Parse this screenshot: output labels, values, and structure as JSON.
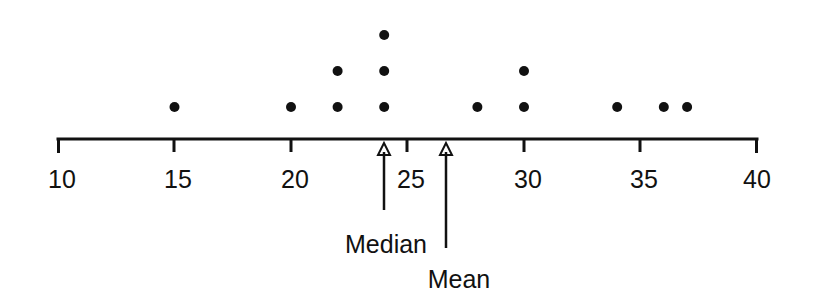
{
  "chart_data": {
    "type": "scatter",
    "plot_kind": "dot-plot",
    "title": "",
    "subtitle": "",
    "xlabel": "",
    "ylabel": "",
    "xlim": [
      10,
      40
    ],
    "grid": false,
    "legend": null,
    "axis_ticks": [
      10,
      15,
      20,
      25,
      30,
      35,
      40
    ],
    "tick_labels": [
      "10",
      "15",
      "20",
      "25",
      "30",
      "35",
      "40"
    ],
    "minor_ticks": false,
    "values": [
      15,
      20,
      22,
      22,
      24,
      24,
      24,
      28,
      30,
      30,
      34,
      36,
      37
    ],
    "stacks": [
      {
        "x": 15,
        "count": 1
      },
      {
        "x": 20,
        "count": 1
      },
      {
        "x": 22,
        "count": 2
      },
      {
        "x": 24,
        "count": 3
      },
      {
        "x": 28,
        "count": 1
      },
      {
        "x": 30,
        "count": 2
      },
      {
        "x": 34,
        "count": 1
      },
      {
        "x": 36,
        "count": 1
      },
      {
        "x": 37,
        "count": 1
      }
    ],
    "total_points": 13,
    "annotations": [
      {
        "name": "median",
        "label": "Median",
        "x": 24
      },
      {
        "name": "mean",
        "label": "Mean",
        "x": 26.6
      }
    ],
    "colors": {
      "dot": "#111111",
      "axis": "#111111",
      "text": "#111111",
      "background": "#ffffff"
    }
  },
  "labels": {
    "median": "Median",
    "mean": "Mean"
  },
  "ticks": {
    "t10": "10",
    "t15": "15",
    "t20": "20",
    "t25": "25",
    "t30": "30",
    "t35": "35",
    "t40": "40"
  }
}
